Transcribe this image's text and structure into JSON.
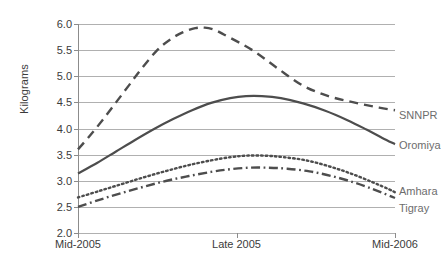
{
  "chart_data": {
    "type": "line",
    "title": "",
    "xlabel": "",
    "ylabel": "Kilograms",
    "x": [
      "Mid-2005",
      "Late 2005",
      "Mid-2006"
    ],
    "xticklabels": [
      "Mid-2005",
      "Late 2005",
      "Mid-2006"
    ],
    "yticklabels": [
      "6.0",
      "5.5",
      "5.0",
      "4.5",
      "4.0",
      "3.5",
      "3.0",
      "2.5",
      "2.0"
    ],
    "ylim": [
      2.0,
      6.0
    ],
    "ytick_step": 0.5,
    "grid": true,
    "legend_position": "inline-right",
    "series": [
      {
        "name": "SNNPR",
        "style": "dashed",
        "color": "#4d4d4d",
        "label_value": "SNNPR",
        "values": [
          3.6,
          5.93,
          4.35
        ],
        "curve": [
          [
            0.0,
            3.6
          ],
          [
            0.08,
            3.88
          ],
          [
            0.16,
            4.18
          ],
          [
            0.24,
            4.5
          ],
          [
            0.32,
            4.82
          ],
          [
            0.4,
            5.14
          ],
          [
            0.5,
            5.5
          ],
          [
            0.58,
            5.7
          ],
          [
            0.66,
            5.84
          ],
          [
            0.74,
            5.92
          ],
          [
            0.8,
            5.93
          ],
          [
            0.86,
            5.89
          ],
          [
            0.92,
            5.8
          ],
          [
            1.1,
            5.5
          ],
          [
            1.26,
            5.15
          ],
          [
            1.42,
            4.82
          ],
          [
            1.58,
            4.62
          ],
          [
            1.74,
            4.5
          ],
          [
            1.9,
            4.4
          ],
          [
            2.0,
            4.35
          ]
        ]
      },
      {
        "name": "Oromiya",
        "style": "solid",
        "color": "#4d4d4d",
        "label_value": "Oromiya",
        "values": [
          3.14,
          4.62,
          3.7
        ],
        "curve": [
          [
            0.0,
            3.14
          ],
          [
            0.12,
            3.34
          ],
          [
            0.24,
            3.56
          ],
          [
            0.36,
            3.78
          ],
          [
            0.48,
            3.99
          ],
          [
            0.6,
            4.18
          ],
          [
            0.72,
            4.35
          ],
          [
            0.84,
            4.49
          ],
          [
            0.96,
            4.58
          ],
          [
            1.06,
            4.62
          ],
          [
            1.16,
            4.62
          ],
          [
            1.28,
            4.58
          ],
          [
            1.42,
            4.48
          ],
          [
            1.56,
            4.34
          ],
          [
            1.7,
            4.16
          ],
          [
            1.82,
            3.98
          ],
          [
            1.92,
            3.82
          ],
          [
            2.0,
            3.7
          ]
        ]
      },
      {
        "name": "Amhara",
        "style": "dotted",
        "color": "#4d4d4d",
        "label_value": "Amhara",
        "values": [
          2.68,
          3.48,
          2.78
        ],
        "curve": [
          [
            0.0,
            2.68
          ],
          [
            0.14,
            2.81
          ],
          [
            0.28,
            2.94
          ],
          [
            0.42,
            3.07
          ],
          [
            0.56,
            3.19
          ],
          [
            0.7,
            3.3
          ],
          [
            0.84,
            3.39
          ],
          [
            0.96,
            3.45
          ],
          [
            1.06,
            3.48
          ],
          [
            1.18,
            3.48
          ],
          [
            1.3,
            3.45
          ],
          [
            1.44,
            3.39
          ],
          [
            1.58,
            3.28
          ],
          [
            1.72,
            3.14
          ],
          [
            1.86,
            2.97
          ],
          [
            1.96,
            2.84
          ],
          [
            2.0,
            2.78
          ]
        ]
      },
      {
        "name": "Tigray",
        "style": "dashdot",
        "color": "#4d4d4d",
        "label_value": "Tigray",
        "values": [
          2.5,
          3.25,
          2.67
        ],
        "curve": [
          [
            0.0,
            2.5
          ],
          [
            0.14,
            2.64
          ],
          [
            0.28,
            2.77
          ],
          [
            0.42,
            2.89
          ],
          [
            0.56,
            3.0
          ],
          [
            0.7,
            3.09
          ],
          [
            0.84,
            3.17
          ],
          [
            0.96,
            3.22
          ],
          [
            1.08,
            3.25
          ],
          [
            1.2,
            3.25
          ],
          [
            1.32,
            3.23
          ],
          [
            1.46,
            3.18
          ],
          [
            1.6,
            3.09
          ],
          [
            1.74,
            2.97
          ],
          [
            1.86,
            2.84
          ],
          [
            1.96,
            2.72
          ],
          [
            2.0,
            2.67
          ]
        ]
      }
    ],
    "series_labels": [
      {
        "text": "SNNPR",
        "value": 4.25
      },
      {
        "text": "Oromiya",
        "value": 3.68
      },
      {
        "text": "Amhara",
        "value": 2.8
      },
      {
        "text": "Tigray",
        "value": 2.48
      }
    ],
    "colors": {
      "line": "#4d4d4d",
      "grid": "#b0b0b0",
      "axis": "#8c8c8c",
      "text": "#3b3b3b",
      "label_text": "#6d6d6d",
      "background": "#ffffff"
    }
  }
}
